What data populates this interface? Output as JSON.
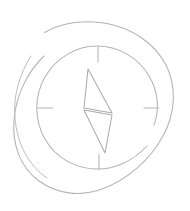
{
  "canvas": {
    "width": 190,
    "height": 211,
    "background": "#ffffff",
    "title": "compass-icon"
  },
  "icon": {
    "name": "compass-icon",
    "style": "hand-drawn-sketch-outline",
    "stroke_color": "#b3b3b3",
    "stroke_color_light": "#c2c2c2",
    "stroke_color_dark": "#a6a6a6",
    "stroke_width": 1,
    "fill": "none",
    "label": ""
  },
  "geometry": {
    "outer_ring": {
      "name": "outer-ring-arc",
      "center_x": 94,
      "center_y": 107,
      "radius_x": 79,
      "radius_y": 85,
      "gap_start_deg": 128,
      "gap_end_deg": 163,
      "path": "M 44.5 32.5 C 63 22 86 19.5 107 23.5 C 133 28.5 155 44 166 65 C 177 87 175.5 113 163 136 C 150 160 127 180 102 189 C 80 197 57 194 39 181 C 21 168 12 146 14 120 C 16 95 27.5 72 44 56"
    },
    "outer_ring_secondary": {
      "name": "outer-ring-arc-secondary",
      "path": "M 31 56 C 19 75 13 97 15 118 C 17 143 28 165 47 178"
    },
    "inner_ring": {
      "name": "inner-ring-circle",
      "center_x": 99,
      "center_y": 108,
      "radius": 61,
      "gap_start_deg": 15,
      "gap_end_deg": 55,
      "path": "M 147 146 C 133 161 114 170 95 169 C 74 168 55 157 45 139 C 34 120 34 96 45 77 C 56 58 76 46 97 46 C 118 46 138 57 149 76 C 158 91 160 109 154 125"
    },
    "ticks": [
      {
        "name": "tick-north",
        "x1": 98,
        "y1": 47,
        "x2": 98,
        "y2": 62,
        "angle_deg": 90,
        "label": "N"
      },
      {
        "name": "tick-east",
        "x1": 159,
        "y1": 108,
        "x2": 144,
        "y2": 108,
        "angle_deg": 0,
        "label": "E"
      },
      {
        "name": "tick-south",
        "x1": 99,
        "y1": 169,
        "x2": 99,
        "y2": 154,
        "angle_deg": 270,
        "label": "S"
      },
      {
        "name": "tick-west",
        "x1": 38,
        "y1": 108,
        "x2": 53,
        "y2": 108,
        "angle_deg": 180,
        "label": "W"
      }
    ],
    "needle": {
      "name": "compass-needle",
      "upper_blade": {
        "name": "needle-upper-blade",
        "points": "88,69 112,113 84,108",
        "path": "M 88 69 L 112 113 L 84 108 Z"
      },
      "lower_blade": {
        "name": "needle-lower-blade",
        "points": "84,110 112,115 105,153",
        "path": "M 84 110 L 112 115 L 105 153 Z"
      },
      "pivot_x": 98,
      "pivot_y": 111
    }
  },
  "accessibility": {
    "alt_text": "compass icon",
    "role": "img"
  }
}
